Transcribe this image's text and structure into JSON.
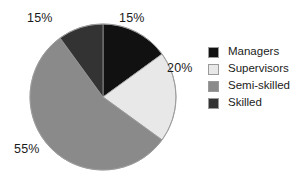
{
  "chart_data": {
    "type": "pie",
    "title": "",
    "categories": [
      "Managers",
      "Supervisors",
      "Semi-skilled",
      "Skilled"
    ],
    "values": [
      15,
      20,
      55,
      15
    ],
    "value_unit": "%",
    "data_labels": [
      "15%",
      "20%",
      "55%",
      "15%"
    ],
    "colors": [
      "#111111",
      "#e8e8e8",
      "#8a8a8a",
      "#333333"
    ],
    "start_angle_deg": 0,
    "direction": "clockwise",
    "legend": {
      "position": "right",
      "entries": [
        {
          "label": "Managers",
          "color": "#111111"
        },
        {
          "label": "Supervisors",
          "color": "#e8e8e8"
        },
        {
          "label": "Semi-skilled",
          "color": "#8a8a8a"
        },
        {
          "label": "Skilled",
          "color": "#333333"
        }
      ]
    },
    "slices": [
      {
        "name": "Managers",
        "value": 15,
        "label": "15%",
        "color": "#111111",
        "start_deg": 0,
        "end_deg": 54
      },
      {
        "name": "Supervisors",
        "value": 20,
        "label": "20%",
        "color": "#e8e8e8",
        "start_deg": 54,
        "end_deg": 126
      },
      {
        "name": "Semi-skilled",
        "value": 55,
        "label": "55%",
        "color": "#8a8a8a",
        "start_deg": 126,
        "end_deg": 324
      },
      {
        "name": "Skilled",
        "value": 15,
        "label": "15%",
        "color": "#333333",
        "start_deg": 324,
        "end_deg": 360
      }
    ],
    "xlabel": "",
    "ylabel": "",
    "grid": false
  },
  "labels": {
    "managers_pct": "15%",
    "supervisors_pct": "20%",
    "semiskilled_pct": "55%",
    "skilled_pct": "15%"
  },
  "legend": {
    "items": [
      {
        "label": "Managers"
      },
      {
        "label": "Supervisors"
      },
      {
        "label": "Semi-skilled"
      },
      {
        "label": "Skilled"
      }
    ]
  },
  "palette": {
    "managers": "#111111",
    "supervisors": "#e8e8e8",
    "semiskilled": "#8a8a8a",
    "skilled": "#333333",
    "outline": "#9a9a9a",
    "background": "#ffffff",
    "text": "#1b1b1b"
  }
}
